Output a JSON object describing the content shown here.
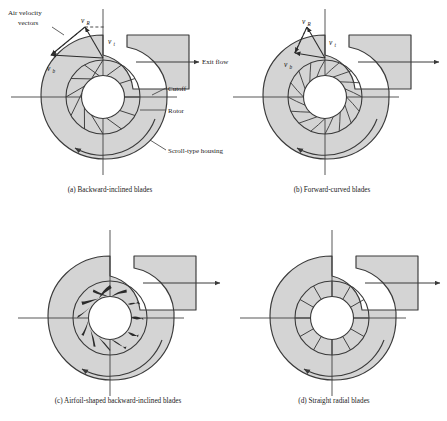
{
  "figure": {
    "background": "#ffffff",
    "housing_fill": "#d4d4d4",
    "line_color": "#3a3a3a",
    "blade_fill": "#2b2b2b"
  },
  "annotations": {
    "air_velocity_line1": "Air velocity",
    "air_velocity_line2": "vectors",
    "exit_flow": "Exit flow",
    "cutoff": "Cutoff",
    "rotor": "Rotor",
    "scroll_housing": "Scroll-type housing"
  },
  "vectors": [
    {
      "name": "v_R",
      "symbol": "v",
      "subscript": "R"
    },
    {
      "name": "v_t",
      "symbol": "v",
      "subscript": "t"
    },
    {
      "name": "v_b",
      "symbol": "v",
      "subscript": "b"
    }
  ],
  "panels": [
    {
      "id": "a",
      "caption": "(a) Backward-inclined blades",
      "blade_type": "backward-inclined",
      "blade_count": 12,
      "has_velocity_vectors": true,
      "has_callouts": true,
      "exit_flow_labeled": true
    },
    {
      "id": "b",
      "caption": "(b) Forward-curved blades",
      "blade_type": "forward-curved",
      "blade_count": 16,
      "has_velocity_vectors": true,
      "has_callouts": false,
      "exit_flow_labeled": false
    },
    {
      "id": "c",
      "caption": "(c) Airfoil-shaped backward-inclined blades",
      "blade_type": "airfoil-shaped backward-inclined",
      "blade_count": 12,
      "has_velocity_vectors": false,
      "has_callouts": false,
      "exit_flow_labeled": false
    },
    {
      "id": "d",
      "caption": "(d) Straight radial blades",
      "blade_type": "straight radial",
      "blade_count": 12,
      "has_velocity_vectors": false,
      "has_callouts": false,
      "exit_flow_labeled": false
    }
  ]
}
